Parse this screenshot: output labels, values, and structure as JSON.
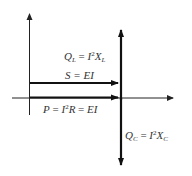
{
  "diagram": {
    "colors": {
      "axis": "#222222",
      "arrow": "#111111",
      "text": "#333333",
      "background": "#ffffff"
    },
    "labels": {
      "ql": {
        "lhs": "Q",
        "lhs_sub": "L",
        "eq": " = ",
        "rhs_base": "I",
        "rhs_sup": "2",
        "rhs_var": "X",
        "rhs_sub": "L"
      },
      "s": {
        "text": "S = EI"
      },
      "p": {
        "lhs": "P",
        "eq1": " = ",
        "mid_base": "I",
        "mid_sup": "2",
        "mid_var": "R",
        "eq2": " = ",
        "rhs": "EI"
      },
      "qc": {
        "lhs": "Q",
        "lhs_sub": "C",
        "eq": " = ",
        "rhs_base": "I",
        "rhs_sup": "2",
        "rhs_var": "X",
        "rhs_sub": "C"
      }
    },
    "elements": [
      {
        "name": "vertical-axis",
        "from": [
          29,
          115
        ],
        "to": [
          29,
          14
        ]
      },
      {
        "name": "horizontal-axis",
        "from": [
          12,
          98
        ],
        "to": [
          173,
          98
        ]
      },
      {
        "name": "s-vector",
        "from": [
          30,
          83
        ],
        "to": [
          118,
          83
        ]
      },
      {
        "name": "p-vector",
        "from": [
          30,
          98
        ],
        "to": [
          118,
          98
        ]
      },
      {
        "name": "reactive-vector",
        "from": [
          121,
          30
        ],
        "to": [
          121,
          165
        ],
        "double_headed": true
      }
    ]
  }
}
